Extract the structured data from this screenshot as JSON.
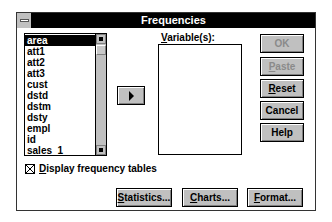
{
  "window": {
    "title": "Frequencies"
  },
  "source_list": {
    "items": [
      {
        "label": "area",
        "selected": true
      },
      {
        "label": "att1",
        "selected": false
      },
      {
        "label": "att2",
        "selected": false
      },
      {
        "label": "att3",
        "selected": false
      },
      {
        "label": "cust",
        "selected": false
      },
      {
        "label": "dstd",
        "selected": false
      },
      {
        "label": "dstm",
        "selected": false
      },
      {
        "label": "dsty",
        "selected": false
      },
      {
        "label": "empl",
        "selected": false
      },
      {
        "label": "id",
        "selected": false
      },
      {
        "label": "sales_1",
        "selected": false
      }
    ]
  },
  "target": {
    "label_mnemonic": "V",
    "label_rest": "ariable(s):"
  },
  "buttons": {
    "ok": "OK",
    "paste": "Paste",
    "reset": "Reset",
    "cancel": "Cancel",
    "help": "Help",
    "statistics": "Statistics...",
    "charts": "Charts...",
    "format": "Format..."
  },
  "checkbox": {
    "label": "Display frequency tables",
    "checked": true
  },
  "icons": {
    "system_menu": "system-menu-icon",
    "move_arrow": "arrow-right-icon",
    "scroll_up": "scroll-up-icon",
    "scroll_down": "scroll-down-icon"
  },
  "colors": {
    "titlebar": "#000000",
    "button_face": "#c0c0c0",
    "selection": "#000000",
    "disabled_text": "#8a8a8a"
  }
}
